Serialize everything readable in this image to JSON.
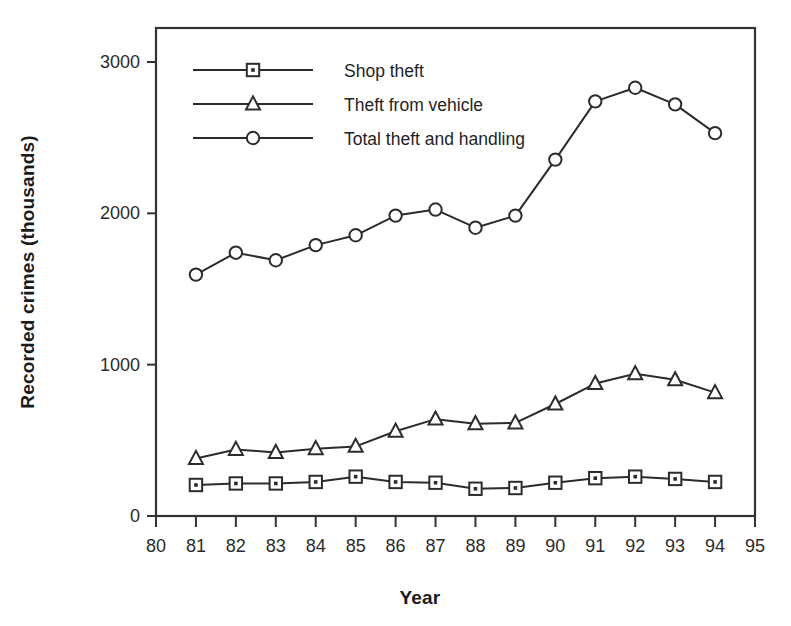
{
  "chart_data": {
    "type": "line",
    "title": "",
    "xlabel": "Year",
    "ylabel": "Recorded crimes (thousands)",
    "x": [
      81,
      82,
      83,
      84,
      85,
      86,
      87,
      88,
      89,
      90,
      91,
      92,
      93,
      94
    ],
    "xtick_labels": [
      "80",
      "81",
      "82",
      "83",
      "84",
      "85",
      "86",
      "87",
      "88",
      "89",
      "90",
      "91",
      "92",
      "93",
      "94",
      "95"
    ],
    "xticks": [
      80,
      81,
      82,
      83,
      84,
      85,
      86,
      87,
      88,
      89,
      90,
      91,
      92,
      93,
      94,
      95
    ],
    "ytick_labels": [
      "0",
      "1000",
      "2000",
      "3000"
    ],
    "yticks": [
      0,
      1000,
      2000,
      3000
    ],
    "xlim": [
      80,
      95
    ],
    "ylim": [
      0,
      3150
    ],
    "grid": false,
    "legend_position": "top-left",
    "series": [
      {
        "name": "Shop theft",
        "marker": "square",
        "values": [
          205,
          215,
          215,
          225,
          260,
          225,
          220,
          180,
          185,
          220,
          250,
          260,
          245,
          225
        ]
      },
      {
        "name": "Theft from vehicle",
        "marker": "triangle",
        "values": [
          380,
          440,
          420,
          445,
          460,
          560,
          640,
          610,
          615,
          740,
          875,
          940,
          900,
          815
        ]
      },
      {
        "name": "Total theft and handling",
        "marker": "circle",
        "values": [
          1595,
          1740,
          1690,
          1790,
          1855,
          1985,
          2025,
          1905,
          1985,
          2355,
          2740,
          2830,
          2720,
          2530
        ]
      }
    ]
  },
  "colors": {
    "line": "#2c2c2c",
    "frame": "#333333",
    "text": "#1a1a1a",
    "background": "#ffffff"
  }
}
